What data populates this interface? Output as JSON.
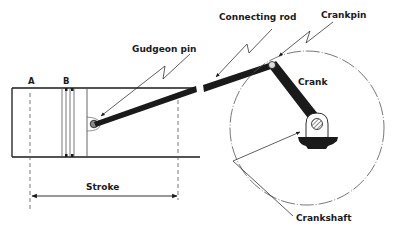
{
  "diagram": {
    "type": "mechanical-schematic",
    "labels": {
      "gudgeon_pin": "Gudgeon pin",
      "connecting_rod": "Connecting rod",
      "crankpin": "Crankpin",
      "crank": "Crank",
      "crankshaft": "Crankshaft",
      "stroke": "Stroke",
      "position_a": "A",
      "position_b": "B"
    },
    "colors": {
      "ink": "#1a1a1a",
      "background": "#ffffff"
    }
  }
}
